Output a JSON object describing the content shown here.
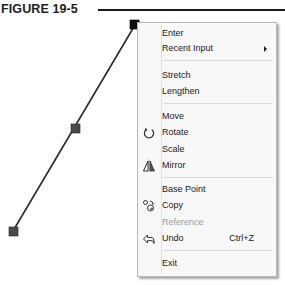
{
  "figure": {
    "title": "FIGURE 19-5"
  },
  "drawing": {
    "line": {
      "x1": 135,
      "y1": 25,
      "x2": 13,
      "y2": 231
    },
    "grips": [
      {
        "name": "end-grip-selected",
        "x": 135,
        "y": 25
      },
      {
        "name": "mid-grip",
        "x": 76,
        "y": 129
      },
      {
        "name": "end-grip",
        "x": 13,
        "y": 231
      }
    ],
    "line_color": "#2a2a2a",
    "grip_color": "#3c3c3c",
    "selected_grip_color": "#111111"
  },
  "context_menu": {
    "items": [
      {
        "label": "Enter",
        "icon": null
      },
      {
        "label": "Recent Input",
        "submenu": true
      },
      {
        "label": "Stretch"
      },
      {
        "label": "Lengthen"
      },
      {
        "label": "Move"
      },
      {
        "label": "Rotate",
        "icon": "rotate-icon"
      },
      {
        "label": "Scale"
      },
      {
        "label": "Mirror",
        "icon": "mirror-icon"
      },
      {
        "label": "Base Point"
      },
      {
        "label": "Copy",
        "icon": "copy-icon"
      },
      {
        "label": "Reference",
        "disabled": true
      },
      {
        "label": "Undo",
        "icon": "undo-icon",
        "shortcut": "Ctrl+Z"
      },
      {
        "label": "Exit"
      }
    ]
  }
}
